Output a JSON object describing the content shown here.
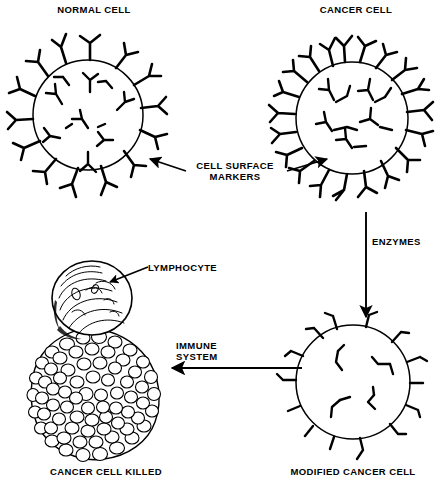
{
  "diagram": {
    "title_semantic": "immune-recognition-of-modified-cancer-cell",
    "ink_color": "#000000",
    "background_color": "#ffffff",
    "labels": {
      "normal_cell": "NORMAL CELL",
      "cancer_cell": "CANCER CELL",
      "cell_surface_markers": "CELL SURFACE\nMARKERS",
      "enzymes": "ENZYMES",
      "immune_system": "IMMUNE\nSYSTEM",
      "lymphocyte": "LYMPHOCYTE",
      "cancer_cell_killed": "CANCER CELL KILLED",
      "modified_cancer_cell": "MODIFIED CANCER CELL"
    },
    "cells": [
      {
        "name": "normal-cell",
        "cx": 88,
        "cy": 115,
        "r": 55,
        "marker_density": "medium",
        "marker_style": "branched-Y",
        "outer_markers": 14,
        "inner_markers": 11
      },
      {
        "name": "cancer-cell",
        "cx": 352,
        "cy": 118,
        "r": 56,
        "marker_density": "high",
        "marker_style": "branched-Y-crowded",
        "outer_markers": 20,
        "inner_markers": 10
      },
      {
        "name": "modified-cancer-cell",
        "cx": 353,
        "cy": 382,
        "r": 57,
        "marker_density": "low",
        "marker_style": "short-stub",
        "outer_markers": 14,
        "inner_markers": 5
      }
    ],
    "killed_cell": {
      "name": "cancer-cell-killed",
      "cx": 95,
      "cy": 390,
      "rx": 62,
      "ry": 62,
      "surface": "bumpy-microvilli"
    },
    "lymphocyte": {
      "name": "lymphocyte",
      "cx": 92,
      "cy": 298,
      "rx": 40,
      "ry": 37,
      "surface": "smooth-mottled"
    },
    "arrows": [
      {
        "name": "arrow-to-normal-cell",
        "from": [
          186,
          170
        ],
        "to": [
          148,
          158
        ],
        "direction": "left"
      },
      {
        "name": "arrow-to-cancer-cell",
        "from": [
          288,
          170
        ],
        "to": [
          330,
          158
        ],
        "direction": "right"
      },
      {
        "name": "arrow-enzymes",
        "from": [
          366,
          212
        ],
        "to": [
          366,
          318
        ],
        "direction": "down"
      },
      {
        "name": "arrow-immune-system",
        "from": [
          300,
          368
        ],
        "to": [
          180,
          368
        ],
        "direction": "left"
      },
      {
        "name": "leader-lymphocyte",
        "from": [
          146,
          268
        ],
        "to": [
          110,
          282
        ],
        "direction": "left"
      }
    ]
  }
}
